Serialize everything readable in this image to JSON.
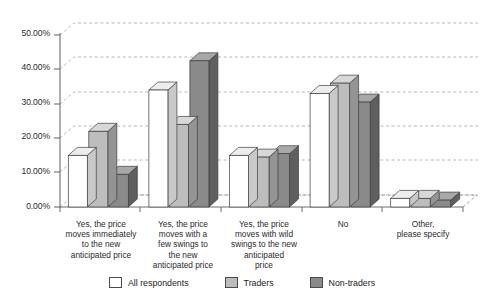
{
  "chart_data": {
    "type": "bar",
    "title": "",
    "subtitle": "",
    "xlabel": "",
    "ylabel": "",
    "ylim": [
      0,
      50
    ],
    "ytick_step": 10,
    "ytick_labels": [
      "0.00%",
      "10.00%",
      "20.00%",
      "30.00%",
      "40.00%",
      "50.00%"
    ],
    "ytick_values": [
      0,
      10,
      20,
      30,
      40,
      50
    ],
    "grid": true,
    "grid_axis": "y",
    "legend_position": "bottom",
    "style": "3d-grouped-columns",
    "categories": [
      "Yes, the price\nmoves immediately\nto the new\nanticipated price",
      "Yes, the price\nmoves with a\nfew swings to\nthe new\nanticipated price",
      "Yes, the price\nmoves with wild\nswings to the new\nanticipated\nprice",
      "No",
      "Other,\nplease specify"
    ],
    "series": [
      {
        "name": "All respondents",
        "color": "#ffffff",
        "side_color": "#c9c9c9",
        "top_color": "#ededed",
        "values": [
          15.0,
          34.0,
          15.0,
          33.0,
          2.5
        ]
      },
      {
        "name": "Traders",
        "color": "#bdbdbd",
        "side_color": "#949494",
        "top_color": "#d8d8d8",
        "values": [
          22.0,
          24.0,
          14.5,
          36.0,
          2.5
        ]
      },
      {
        "name": "Non-traders",
        "color": "#8a8a8a",
        "side_color": "#5f5f5f",
        "top_color": "#a8a8a8",
        "values": [
          9.5,
          42.5,
          15.5,
          30.5,
          2.0
        ]
      }
    ]
  },
  "axis": {
    "ytick_0": "0.00%",
    "ytick_1": "10.00%",
    "ytick_2": "20.00%",
    "ytick_3": "30.00%",
    "ytick_4": "40.00%",
    "ytick_5": "50.00%"
  },
  "categories_text": {
    "c0": "Yes, the price\nmoves immediately\nto the new\nanticipated price",
    "c1": "Yes, the price\nmoves with a\nfew swings to\nthe new\nanticipated price",
    "c2": "Yes, the price\nmoves with wild\nswings to the new\nanticipated\nprice",
    "c3": "No",
    "c4": "Other,\nplease specify"
  },
  "legend": {
    "items": [
      {
        "label": "All respondents"
      },
      {
        "label": "Traders"
      },
      {
        "label": "Non-traders"
      }
    ]
  }
}
